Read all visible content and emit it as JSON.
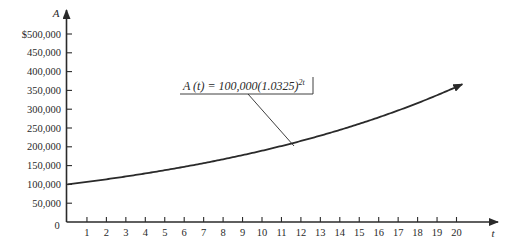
{
  "chart_data": {
    "type": "line",
    "title": "",
    "xlabel": "t",
    "ylabel": "A",
    "xlim": [
      0,
      20
    ],
    "ylim": [
      0,
      500000
    ],
    "grid": false,
    "x_ticks": [
      1,
      2,
      3,
      4,
      5,
      6,
      7,
      8,
      9,
      10,
      11,
      12,
      13,
      14,
      15,
      16,
      17,
      18,
      19,
      20
    ],
    "y_ticks": [
      0,
      50000,
      100000,
      150000,
      200000,
      250000,
      300000,
      350000,
      400000,
      450000,
      500000
    ],
    "y_tick_labels": [
      "0",
      "50,000",
      "100,000",
      "150,000",
      "200,000",
      "250,000",
      "300,000",
      "350,000",
      "400,000",
      "450,000",
      "$500,000"
    ],
    "x_origin_label": "0",
    "series": [
      {
        "name": "A(t) = 100,000(1.0325)^2t",
        "function": "100000*1.0325^(2t)",
        "x": [
          0,
          2,
          4,
          6,
          8,
          10,
          12,
          14,
          16,
          18,
          20
        ],
        "values": [
          100000,
          113659,
          129183,
          146829,
          166883,
          189678,
          215586,
          245032,
          278500,
          316540,
          359775
        ]
      }
    ],
    "annotations": [
      {
        "text_main": "A (t) = 100,000(1.0325)",
        "text_sup": "2t",
        "points_to_t": 11.6
      }
    ]
  }
}
